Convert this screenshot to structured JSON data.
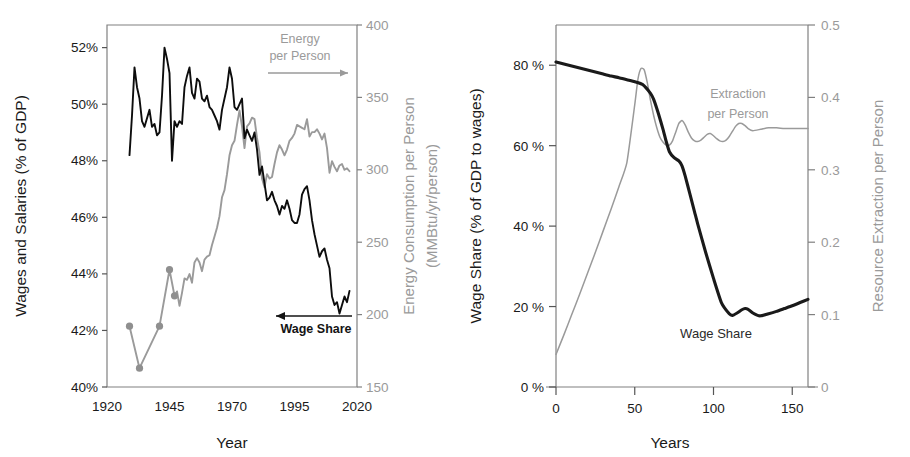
{
  "figure": {
    "panels": [
      "left",
      "right"
    ],
    "background": "#ffffff",
    "colors": {
      "dark_series": "#0d0d0d",
      "gray_series": "#9a9a9a",
      "axis": "#808080",
      "text": "#1a1a1a",
      "gray_text": "#9a9a9a"
    }
  },
  "chart_data": [
    {
      "id": "historical-us",
      "type": "line",
      "title": "",
      "xlabel": "Year",
      "ylabel": "Wages and Salaries (% of GDP)",
      "y2label": "Energy Consumption per Person",
      "y2label_units": "(MMBtu/yr/person)",
      "xlim": [
        1920,
        2020
      ],
      "ylim": [
        40,
        52.8
      ],
      "y2lim": [
        150,
        400
      ],
      "xticks": [
        1920,
        1945,
        1970,
        1995,
        2020
      ],
      "xticklabels": [
        "1920",
        "1945",
        "1970",
        "1995",
        "2020"
      ],
      "yticks": [
        40,
        42,
        44,
        46,
        48,
        50,
        52
      ],
      "yticklabels": [
        "40%",
        "42%",
        "44%",
        "46%",
        "48%",
        "50%",
        "52%"
      ],
      "y2ticks": [
        150,
        200,
        250,
        300,
        350,
        400
      ],
      "y2ticklabels": [
        "150",
        "200",
        "250",
        "300",
        "350",
        "400"
      ],
      "grid": false,
      "legend": "annotations",
      "annotations": [
        {
          "text_line1": "Energy",
          "text_line2": "per Person",
          "arrow": "right",
          "color": "#9a9a9a",
          "name": "energy-per-person-annotation"
        },
        {
          "text_line1": "Wage Share",
          "text_line2": "",
          "arrow": "left",
          "color": "#141414",
          "name": "wage-share-annotation"
        }
      ],
      "series": [
        {
          "name": "Wage Share",
          "axis": "left",
          "color": "#0d0d0d",
          "markers": false,
          "x": [
            1929,
            1930,
            1931,
            1932,
            1933,
            1934,
            1935,
            1936,
            1937,
            1938,
            1939,
            1940,
            1941,
            1942,
            1943,
            1944,
            1945,
            1946,
            1947,
            1948,
            1949,
            1950,
            1951,
            1952,
            1953,
            1954,
            1955,
            1956,
            1957,
            1958,
            1959,
            1960,
            1961,
            1962,
            1963,
            1964,
            1965,
            1966,
            1967,
            1968,
            1969,
            1970,
            1971,
            1972,
            1973,
            1974,
            1975,
            1976,
            1977,
            1978,
            1979,
            1980,
            1981,
            1982,
            1983,
            1984,
            1985,
            1986,
            1987,
            1988,
            1989,
            1990,
            1991,
            1992,
            1993,
            1994,
            1995,
            1996,
            1997,
            1998,
            1999,
            2000,
            2001,
            2002,
            2003,
            2004,
            2005,
            2006,
            2007,
            2008,
            2009,
            2010,
            2011,
            2012,
            2013,
            2014,
            2015,
            2016,
            2017
          ],
          "y": [
            48.2,
            49.6,
            51.3,
            50.6,
            50.2,
            49.4,
            49.2,
            49.5,
            49.8,
            49.2,
            49.3,
            48.9,
            49.0,
            50.3,
            52.0,
            51.6,
            51.1,
            48.0,
            49.4,
            49.2,
            49.4,
            49.3,
            50.6,
            51.0,
            51.3,
            50.4,
            50.2,
            50.9,
            50.8,
            50.2,
            50.1,
            50.3,
            49.9,
            49.8,
            49.6,
            49.4,
            49.1,
            49.8,
            50.2,
            50.6,
            51.3,
            50.9,
            49.9,
            49.8,
            50.0,
            50.2,
            48.8,
            49.1,
            48.9,
            48.7,
            49.0,
            48.4,
            47.5,
            47.8,
            47.2,
            46.6,
            46.7,
            46.9,
            46.6,
            46.4,
            46.1,
            46.4,
            46.3,
            46.6,
            46.3,
            45.9,
            45.8,
            45.8,
            46.1,
            46.8,
            47.0,
            47.1,
            46.6,
            45.9,
            45.4,
            45.0,
            44.6,
            44.8,
            44.9,
            44.5,
            44.2,
            43.2,
            42.9,
            43.0,
            42.6,
            42.9,
            43.2,
            43.0,
            43.4
          ]
        },
        {
          "name": "Energy per Person",
          "axis": "right",
          "color": "#9a9a9a",
          "markers": true,
          "marker_x": [
            1929,
            1933,
            1941,
            1945,
            1947
          ],
          "marker_y": [
            192,
            163,
            192,
            231,
            213
          ],
          "x": [
            1929,
            1933,
            1941,
            1945,
            1947,
            1948,
            1949,
            1950,
            1951,
            1952,
            1953,
            1954,
            1955,
            1956,
            1957,
            1958,
            1959,
            1960,
            1961,
            1962,
            1963,
            1964,
            1965,
            1966,
            1967,
            1968,
            1969,
            1970,
            1971,
            1972,
            1973,
            1974,
            1975,
            1976,
            1977,
            1978,
            1979,
            1980,
            1981,
            1982,
            1983,
            1984,
            1985,
            1986,
            1987,
            1988,
            1989,
            1990,
            1991,
            1992,
            1993,
            1994,
            1995,
            1996,
            1997,
            1998,
            1999,
            2000,
            2001,
            2002,
            2003,
            2004,
            2005,
            2006,
            2007,
            2008,
            2009,
            2010,
            2011,
            2012,
            2013,
            2014,
            2015,
            2016,
            2017
          ],
          "y": [
            192,
            163,
            192,
            231,
            213,
            216,
            206,
            215,
            225,
            224,
            228,
            222,
            236,
            239,
            236,
            230,
            238,
            240,
            241,
            248,
            254,
            260,
            268,
            281,
            286,
            297,
            310,
            317,
            320,
            331,
            341,
            330,
            315,
            330,
            332,
            336,
            335,
            322,
            312,
            294,
            288,
            297,
            294,
            295,
            304,
            312,
            317,
            314,
            310,
            314,
            320,
            322,
            325,
            331,
            330,
            329,
            328,
            335,
            323,
            326,
            326,
            328,
            325,
            321,
            325,
            315,
            298,
            306,
            302,
            299,
            303,
            304,
            300,
            301,
            299
          ]
        }
      ]
    },
    {
      "id": "model-simulation",
      "type": "line",
      "title": "",
      "xlabel": "Years",
      "ylabel": "Wage Share (% of GDP to wages)",
      "y2label": "Resource Extraction per Person",
      "xlim": [
        0,
        160
      ],
      "ylim": [
        0,
        90
      ],
      "y2lim": [
        0,
        0.5
      ],
      "xticks": [
        0,
        50,
        100,
        150
      ],
      "xticklabels": [
        "0",
        "50",
        "100",
        "150"
      ],
      "yticks": [
        0,
        20,
        40,
        60,
        80
      ],
      "yticklabels": [
        "0 %",
        "20 %",
        "40 %",
        "60 %",
        "80 %"
      ],
      "y2ticks": [
        0,
        0.1,
        0.2,
        0.3,
        0.4,
        0.5
      ],
      "y2ticklabels": [
        "0",
        "0.1",
        "0.2",
        "0.3",
        "0.4",
        "0.5"
      ],
      "grid": false,
      "legend": "annotations",
      "annotations": [
        {
          "text_line1": "Extraction",
          "text_line2": "per Person",
          "arrow": "none",
          "color": "#9a9a9a",
          "name": "extraction-per-person-annotation"
        },
        {
          "text_line1": "Wage Share",
          "text_line2": "",
          "arrow": "none",
          "color": "#2a2a2a",
          "name": "wage-share-annotation"
        }
      ],
      "series": [
        {
          "name": "Wage Share",
          "axis": "left",
          "color": "#1a1a1a",
          "markers": false,
          "x": [
            0,
            5,
            10,
            15,
            20,
            25,
            30,
            35,
            40,
            45,
            50,
            55,
            60,
            62,
            65,
            68,
            70,
            72,
            75,
            78,
            80,
            82,
            85,
            88,
            90,
            95,
            100,
            105,
            110,
            112,
            115,
            118,
            120,
            122,
            125,
            128,
            130,
            135,
            140,
            145,
            150,
            155,
            160
          ],
          "y": [
            80.8,
            80.3,
            79.8,
            79.3,
            78.8,
            78.3,
            77.8,
            77.3,
            76.9,
            76.4,
            75.9,
            75.2,
            73.0,
            71.5,
            68.0,
            64.0,
            61.0,
            58.5,
            57.0,
            56.2,
            55.0,
            52.5,
            48.0,
            43.5,
            40.5,
            33.5,
            27.0,
            21.0,
            18.2,
            17.8,
            18.4,
            19.2,
            19.5,
            19.3,
            18.4,
            17.8,
            17.7,
            18.2,
            18.8,
            19.5,
            20.2,
            21.0,
            21.8
          ]
        },
        {
          "name": "Extraction per Person",
          "axis": "right",
          "color": "#9a9a9a",
          "markers": false,
          "x": [
            0,
            5,
            10,
            15,
            20,
            25,
            30,
            35,
            40,
            45,
            50,
            52,
            54,
            56,
            58,
            60,
            62,
            64,
            66,
            68,
            70,
            72,
            74,
            76,
            78,
            80,
            82,
            84,
            86,
            88,
            90,
            92,
            94,
            96,
            98,
            100,
            102,
            104,
            106,
            108,
            110,
            112,
            114,
            116,
            118,
            120,
            122,
            125,
            130,
            135,
            140,
            145,
            150,
            155,
            160
          ],
          "y": [
            0.045,
            0.072,
            0.1,
            0.128,
            0.157,
            0.186,
            0.216,
            0.246,
            0.277,
            0.31,
            0.39,
            0.425,
            0.44,
            0.438,
            0.42,
            0.396,
            0.375,
            0.358,
            0.345,
            0.338,
            0.334,
            0.334,
            0.34,
            0.352,
            0.364,
            0.368,
            0.362,
            0.352,
            0.344,
            0.34,
            0.339,
            0.341,
            0.345,
            0.349,
            0.35,
            0.347,
            0.343,
            0.34,
            0.339,
            0.341,
            0.346,
            0.353,
            0.36,
            0.364,
            0.364,
            0.361,
            0.357,
            0.354,
            0.356,
            0.358,
            0.358,
            0.357,
            0.357,
            0.357,
            0.357
          ]
        }
      ]
    }
  ]
}
